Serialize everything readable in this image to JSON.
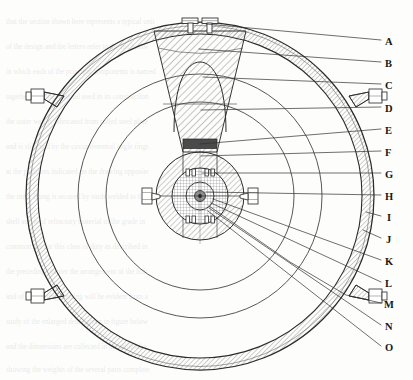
{
  "figure": {
    "kind": "engineering-cross-section",
    "view": "circular cross-section with concentric shells, hatched wedge sector and central hub",
    "background_note": "scanned book page with faint show-through text behind the line art"
  },
  "style": {
    "line_color": "#2b2b2b",
    "hatch_color": "#6d6d6d",
    "light_line": "#555555",
    "dark_fill": "#4a4a4a",
    "paper": "#fdfdfc",
    "label_color": "#181818",
    "leader_color": "#303030"
  },
  "callouts": [
    {
      "id": "A",
      "label": "A",
      "x": 389,
      "y": 42,
      "anchor_x": 206,
      "anchor_y": 24
    },
    {
      "id": "B",
      "label": "B",
      "x": 389,
      "y": 64,
      "anchor_x": 199,
      "anchor_y": 49
    },
    {
      "id": "C",
      "label": "C",
      "x": 389,
      "y": 86,
      "anchor_x": 203,
      "anchor_y": 77
    },
    {
      "id": "D",
      "label": "D",
      "x": 389,
      "y": 109,
      "anchor_x": 201,
      "anchor_y": 110
    },
    {
      "id": "E",
      "label": "E",
      "x": 389,
      "y": 131,
      "anchor_x": 200,
      "anchor_y": 144
    },
    {
      "id": "F",
      "label": "F",
      "x": 389,
      "y": 153,
      "anchor_x": 201,
      "anchor_y": 155
    },
    {
      "id": "G",
      "label": "G",
      "x": 389,
      "y": 175,
      "anchor_x": 202,
      "anchor_y": 172
    },
    {
      "id": "H",
      "label": "H",
      "x": 389,
      "y": 197,
      "anchor_x": 206,
      "anchor_y": 192
    },
    {
      "id": "I",
      "label": "I",
      "x": 389,
      "y": 218,
      "anchor_x": 367,
      "anchor_y": 212
    },
    {
      "id": "J",
      "label": "J",
      "x": 389,
      "y": 240,
      "anchor_x": 365,
      "anchor_y": 231
    },
    {
      "id": "K",
      "label": "K",
      "x": 389,
      "y": 262,
      "anchor_x": 213,
      "anchor_y": 199
    },
    {
      "id": "L",
      "label": "L",
      "x": 389,
      "y": 284,
      "anchor_x": 211,
      "anchor_y": 203
    },
    {
      "id": "M",
      "label": "M",
      "x": 389,
      "y": 305,
      "anchor_x": 340,
      "anchor_y": 295
    },
    {
      "id": "N",
      "label": "N",
      "x": 389,
      "y": 327,
      "anchor_x": 209,
      "anchor_y": 208
    },
    {
      "id": "O",
      "label": "O",
      "x": 389,
      "y": 348,
      "anchor_x": 208,
      "anchor_y": 211
    }
  ],
  "geometry": {
    "center": {
      "x": 200,
      "y": 196
    },
    "circles": [
      {
        "name": "outer-shell-outer",
        "r": 174
      },
      {
        "name": "outer-shell-inner",
        "r": 167
      },
      {
        "name": "inner-shell-outer",
        "r": 162
      },
      {
        "name": "mid-ring",
        "r": 122
      },
      {
        "name": "inner-ring",
        "r": 94
      },
      {
        "name": "hub-outer",
        "r": 44
      },
      {
        "name": "hub-mid",
        "r": 28
      },
      {
        "name": "hub-core",
        "r": 14
      },
      {
        "name": "shaft-circle",
        "r": 5.5
      }
    ],
    "wedge": {
      "top_half_width": 46,
      "bottom_half_width": 17,
      "top_y": 27,
      "bottom_y": 152
    },
    "dome": {
      "cx": 200,
      "cy": 122,
      "rx": 40,
      "ry": 56
    },
    "dark_block": {
      "x": 183,
      "y": 140,
      "w": 34,
      "h": 9
    },
    "lugs": [
      {
        "name": "lug-upper-left",
        "angle_deg": 215
      },
      {
        "name": "lug-upper-right",
        "angle_deg": 325
      },
      {
        "name": "lug-lower-left",
        "angle_deg": 145
      },
      {
        "name": "lug-lower-right",
        "angle_deg": 35
      }
    ],
    "top_fitting": {
      "x": 200,
      "y": 22
    }
  },
  "background_text_rows": [
    "the cross  section  of  the  vessel  assembly  shown",
    "in  figure  indicates  the  principal  internal  parts",
    "and  the  arrangement  of  the  concentric  shells",
    "together  with  the  supporting  lugs  and  fittings",
    "which  are  welded  to  the  outer  cylindrical  wall",
    "the  central  hub  carries  the  rotating  shaft  and",
    "bearing  assembly  indicated  by  the  letters  G  H",
    "the  hatched  sector  represents  the  charge  region",
    "bounded  above  by  the  domed  deflector  surface",
    "and  below  by  the  annular  retaining  collar  ring",
    "details  of  the  bolted  connections  are  given  in",
    "the  accompanying  tables  of  the  following  page"
  ]
}
